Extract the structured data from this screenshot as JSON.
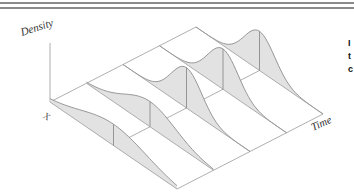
{
  "chart_data": {
    "type": "3d-ridgeline-density",
    "title": "",
    "xlabel": "X",
    "ylabel": "Density",
    "zlabel": "Time",
    "grid": true,
    "slices": [
      {
        "time_index": 0,
        "mean": 0.5,
        "sd": 0.26,
        "peak_height": 0.38
      },
      {
        "time_index": 1,
        "mean": 0.5,
        "sd": 0.2,
        "peak_height": 0.45
      },
      {
        "time_index": 2,
        "mean": 0.5,
        "sd": 0.12,
        "peak_height": 0.72
      },
      {
        "time_index": 3,
        "mean": 0.5,
        "sd": 0.12,
        "peak_height": 0.72
      },
      {
        "time_index": 4,
        "mean": 0.5,
        "sd": 0.12,
        "peak_height": 0.7
      }
    ],
    "colors": {
      "fill": "#e2e2e2",
      "line": "#8c8c8c",
      "grid": "#9a9a9a"
    }
  },
  "labels": {
    "density": "Density",
    "x": "X",
    "time": "Time"
  },
  "side_text": [
    "I",
    "t",
    "c"
  ]
}
